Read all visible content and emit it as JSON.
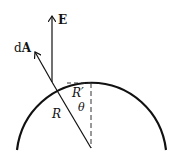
{
  "diagram": {
    "labels": {
      "field": "E",
      "area_prefix": "d",
      "area_vector": "A",
      "radius": "R",
      "projection": "R′",
      "angle": "θ"
    },
    "colors": {
      "stroke": "#111111",
      "dashed": "#333333",
      "background": "#ffffff"
    },
    "geometry": {
      "circle_center": [
        91,
        148
      ],
      "circle_radius": 76,
      "surface_point": [
        52,
        82
      ]
    }
  }
}
